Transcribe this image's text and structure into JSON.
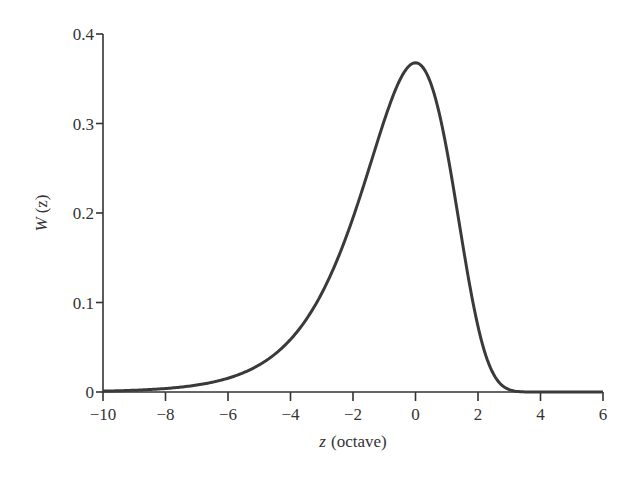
{
  "chart_data": {
    "type": "line",
    "title": "",
    "xlabel": "z (octave)",
    "xlabel_var": "z",
    "xlabel_unit": "(octave)",
    "ylabel": "W (z)",
    "ylabel_var": "W",
    "ylabel_arg": "(z)",
    "xlim": [
      -10,
      6
    ],
    "ylim": [
      0,
      0.4
    ],
    "grid": false,
    "legend": null,
    "x_ticks": [
      -10,
      -8,
      -6,
      -4,
      -2,
      0,
      2,
      4,
      6
    ],
    "x_tick_labels": [
      "−10",
      "−8",
      "−6",
      "−4",
      "−2",
      "0",
      "2",
      "4",
      "6"
    ],
    "y_ticks": [
      0,
      0.1,
      0.2,
      0.3,
      0.4
    ],
    "y_tick_labels": [
      "0",
      "0.1",
      "0.2",
      "0.3",
      "0.4"
    ],
    "series": [
      {
        "name": "W(z)",
        "color": "#3a3a3a",
        "x": [
          -10,
          -9,
          -8,
          -7,
          -6,
          -5,
          -4,
          -3.5,
          -3,
          -2.5,
          -2,
          -1.5,
          -1,
          -0.5,
          0,
          0.5,
          1,
          1.5,
          2,
          2.5,
          3,
          3.5,
          4,
          5,
          6
        ],
        "values": [
          0.001,
          0.002,
          0.0039,
          0.0077,
          0.0154,
          0.0303,
          0.0587,
          0.0808,
          0.1103,
          0.1491,
          0.1947,
          0.248,
          0.3033,
          0.3494,
          0.3679,
          0.3435,
          0.2707,
          0.1672,
          0.0733,
          0.0197,
          0.0027,
          0.0001,
          0.0,
          0.0,
          0.0
        ]
      }
    ]
  }
}
